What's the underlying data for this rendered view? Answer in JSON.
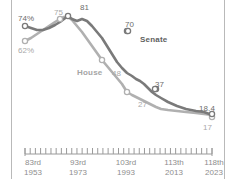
{
  "chart_data": {
    "type": "line",
    "title": "",
    "subtitle": "",
    "xlabel": "",
    "ylabel": "",
    "grid": false,
    "legend_position": "inline-annotations",
    "x_axis": {
      "ticks": [
        {
          "congress": "83rd",
          "year": "1953"
        },
        {
          "congress": "93rd",
          "year": "1973"
        },
        {
          "congress": "103rd",
          "year": "1993"
        },
        {
          "congress": "113th",
          "year": "2013"
        },
        {
          "congress": "118th",
          "year": "2023"
        }
      ],
      "minor_tick_count": 36
    },
    "series": [
      {
        "name": "Senate",
        "color": "#7a7a7a",
        "labeled_points": [
          {
            "label": "74%",
            "value": 74
          },
          {
            "label": "81",
            "value": 81
          },
          {
            "label": "70",
            "value": 70
          },
          {
            "label": "37",
            "value": 37
          },
          {
            "label": "18.4",
            "value": 18.4
          }
        ],
        "values": [
          74,
          73,
          72,
          72,
          73,
          75,
          77,
          79,
          81,
          79,
          78,
          79,
          78,
          74,
          70,
          66,
          60,
          53,
          46,
          41,
          37,
          34,
          32,
          31,
          29,
          26,
          24,
          22,
          21,
          20,
          19.2,
          18.4
        ]
      },
      {
        "name": "House",
        "color": "#b0b0b0",
        "labeled_points": [
          {
            "label": "62%",
            "value": 62
          },
          {
            "label": "75",
            "value": 75
          },
          {
            "label": "48",
            "value": 48
          },
          {
            "label": "27",
            "value": 27
          },
          {
            "label": "17",
            "value": 17
          }
        ],
        "values": [
          62,
          65,
          68,
          71,
          73,
          75,
          77,
          78,
          78,
          76,
          72,
          68,
          63,
          58,
          53,
          48,
          44,
          40,
          36,
          32,
          27,
          25,
          24,
          23,
          22,
          21,
          20,
          19,
          18,
          17.5,
          17.2,
          17
        ]
      }
    ]
  },
  "annotations": {
    "senate_label": "Senate",
    "house_label": "House",
    "senate_start": "74%",
    "house_start": "62%",
    "house_cross": "75",
    "senate_peak": "81",
    "senate_mid": "70",
    "house_mid": "48",
    "senate_late": "37",
    "house_late": "27",
    "senate_end": "18.4",
    "house_end": "17"
  },
  "axis": {
    "t1_congress": "83rd",
    "t1_year": "1953",
    "t2_congress": "93rd",
    "t2_year": "1973",
    "t3_congress": "103rd",
    "t3_year": "1993",
    "t4_congress": "113th",
    "t4_year": "2013",
    "t5_congress": "118th",
    "t5_year": "2023"
  },
  "colors": {
    "senate": "#7a7a7a",
    "house": "#b0b0b0",
    "frame": "#b9b9b9",
    "text": "#8e8e8e",
    "background": "#ffffff"
  }
}
